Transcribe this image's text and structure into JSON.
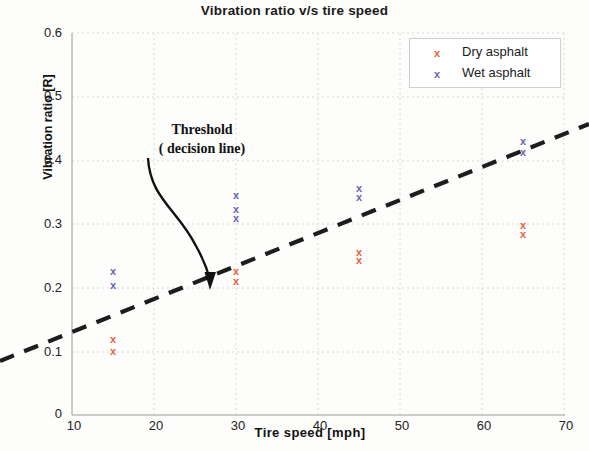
{
  "chart_data": {
    "type": "scatter",
    "title": "Vibration  ratio v/s tire speed",
    "xlabel": "Tire speed [mph]",
    "ylabel": "Vibration ratio [R]",
    "xlim": [
      10,
      70
    ],
    "ylim": [
      0,
      0.6
    ],
    "xticks": [
      "10",
      "20",
      "30",
      "40",
      "50",
      "60",
      "70"
    ],
    "yticks": [
      "0",
      "0.1",
      "0.2",
      "0.3",
      "0.4",
      "0.5",
      "0.6"
    ],
    "grid": true,
    "legend_position": "top-right",
    "series": [
      {
        "name": "Dry asphalt",
        "color": "#e8613c",
        "marker": "x",
        "points": [
          {
            "x": 15,
            "y": 0.119
          },
          {
            "x": 15,
            "y": 0.099
          },
          {
            "x": 30,
            "y": 0.225
          },
          {
            "x": 30,
            "y": 0.21
          },
          {
            "x": 45,
            "y": 0.255
          },
          {
            "x": 45,
            "y": 0.243
          },
          {
            "x": 65,
            "y": 0.298
          },
          {
            "x": 65,
            "y": 0.283
          }
        ]
      },
      {
        "name": "Wet asphalt",
        "color": "#6a62b8",
        "marker": "x",
        "points": [
          {
            "x": 15,
            "y": 0.226
          },
          {
            "x": 15,
            "y": 0.204
          },
          {
            "x": 30,
            "y": 0.345
          },
          {
            "x": 30,
            "y": 0.322
          },
          {
            "x": 30,
            "y": 0.308
          },
          {
            "x": 45,
            "y": 0.356
          },
          {
            "x": 45,
            "y": 0.341
          },
          {
            "x": 65,
            "y": 0.43
          },
          {
            "x": 65,
            "y": 0.413
          }
        ]
      }
    ],
    "threshold_line": {
      "label": "Threshold ( decision line)",
      "style": "dashed",
      "color": "#1a1a1a",
      "from": {
        "x": 9.2,
        "y": 0.086
      },
      "to": {
        "x": 73.0,
        "y": 0.456
      }
    },
    "annotation": {
      "line1": "Threshold",
      "line2": "( decision line)",
      "arrow_target": {
        "x": 26.5,
        "y": 0.205
      }
    }
  },
  "legend": {
    "entries": [
      {
        "label": "Dry asphalt",
        "swatch": "x",
        "color": "#e8613c"
      },
      {
        "label": "Wet asphalt",
        "swatch": "x",
        "color": "#6a62b8"
      }
    ]
  }
}
